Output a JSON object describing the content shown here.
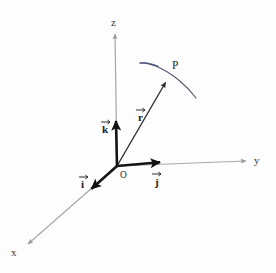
{
  "figure": {
    "background_color": "#fdfdfd"
  },
  "colors": {
    "axis_line": "#a8a8a8",
    "unit_vector": "#141414",
    "position_vector": "#2d2d2d",
    "curve": "#55586b",
    "curve_tint": "#4a5280",
    "text": "#2b2b2b"
  },
  "axes": [
    {
      "id": "x",
      "label": "x",
      "label_x": 11,
      "label_y": 256,
      "from": [
        117,
        166
      ],
      "to": [
        26,
        246
      ],
      "arrow": true
    },
    {
      "id": "y",
      "label": "y",
      "label_x": 254,
      "label_y": 164,
      "from": [
        117,
        166
      ],
      "to": [
        248,
        161
      ],
      "arrow": true
    },
    {
      "id": "z",
      "label": "z",
      "label_x": 111,
      "label_y": 26,
      "from": [
        117,
        166
      ],
      "to": [
        115,
        32
      ],
      "arrow": true
    }
  ],
  "unit_vectors": [
    {
      "id": "i",
      "label": "i",
      "label_x": 81,
      "label_y": 188,
      "accent": "arrow",
      "from": [
        117,
        166
      ],
      "to": [
        89,
        191
      ]
    },
    {
      "id": "j",
      "label": "j",
      "label_x": 154,
      "label_y": 185,
      "accent": "arrow",
      "from": [
        117,
        166
      ],
      "to": [
        163,
        162
      ]
    },
    {
      "id": "k",
      "label": "k",
      "label_x": 102,
      "label_y": 133,
      "accent": "arrow",
      "from": [
        117,
        166
      ],
      "to": [
        116,
        118
      ]
    }
  ],
  "position_vector": {
    "id": "r",
    "label": "r",
    "label_x": 139,
    "label_y": 120,
    "accent": "arrow",
    "from": [
      117,
      166
    ],
    "to": [
      167,
      80
    ]
  },
  "point": {
    "id": "P",
    "label": "P",
    "label_x": 173,
    "label_y": 68,
    "x": 167,
    "y": 80
  },
  "curve": {
    "id": "surface-curve",
    "path": "M 140,63 C 152,62 170,72 182,83 C 188,88 193,94 196,98",
    "description": "arc of a curve passing through point P"
  }
}
